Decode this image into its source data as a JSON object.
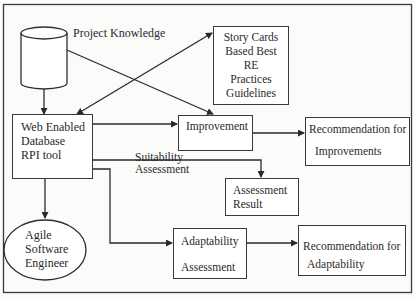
{
  "diagram": {
    "type": "flowchart",
    "nodes": {
      "project_knowledge": {
        "label": "Project Knowledge",
        "shape": "cylinder"
      },
      "story_cards": {
        "lines": [
          "Story Cards",
          "Based Best",
          "RE",
          "Practices",
          "Guidelines"
        ],
        "shape": "rectangle"
      },
      "web_tool": {
        "lines": [
          "Web Enabled",
          "Database",
          "RPI tool"
        ],
        "shape": "rectangle"
      },
      "improvement": {
        "label": "Improvement",
        "shape": "rectangle"
      },
      "rec_improvements": {
        "lines": [
          "Recommendation for",
          "Improvements"
        ],
        "shape": "rectangle"
      },
      "suitability": {
        "lines": [
          "Suitability",
          "Assessment"
        ],
        "shape": "label"
      },
      "assessment_result": {
        "lines": [
          "Assessment",
          "Result"
        ],
        "shape": "rectangle"
      },
      "agile_engineer": {
        "lines": [
          "Agile",
          "Software",
          "Engineer"
        ],
        "shape": "ellipse"
      },
      "adaptability": {
        "lines": [
          "Adaptability",
          "Assessment"
        ],
        "shape": "rectangle"
      },
      "rec_adaptability": {
        "lines": [
          "Recommendation for",
          "Adaptability"
        ],
        "shape": "rectangle"
      }
    },
    "edges": [
      {
        "from": "Project Knowledge",
        "to": "Web Enabled Database RPI tool"
      },
      {
        "from": "Project Knowledge",
        "to": "Improvement"
      },
      {
        "from": "Web Enabled Database RPI tool",
        "to": "Story Cards Based Best RE Practices Guidelines",
        "bidirectional": true
      },
      {
        "from": "Web Enabled Database RPI tool",
        "to": "Improvement"
      },
      {
        "from": "Improvement",
        "to": "Recommendation for Improvements"
      },
      {
        "from": "Web Enabled Database RPI tool",
        "to": "Assessment Result",
        "label": "Suitability Assessment"
      },
      {
        "from": "Web Enabled Database RPI tool",
        "to": "Agile Software Engineer"
      },
      {
        "from": "Web Enabled Database RPI tool",
        "to": "Adaptability Assessment"
      },
      {
        "from": "Adaptability Assessment",
        "to": "Recommendation for Adaptability"
      }
    ]
  }
}
